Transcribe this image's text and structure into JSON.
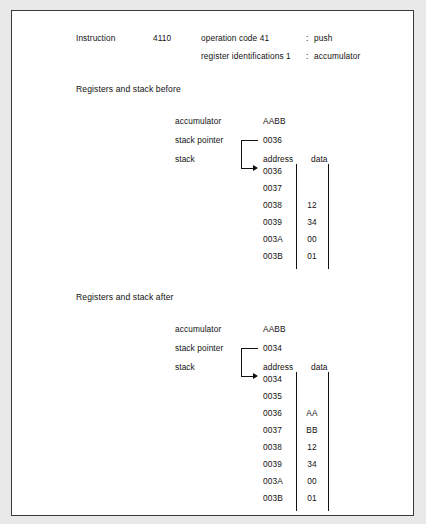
{
  "figure": {
    "instruction": {
      "label": "Instruction",
      "value": "4110",
      "fields": [
        {
          "name": "operation code 41",
          "colon": ":",
          "meaning": "push"
        },
        {
          "name": "register identifications 1",
          "colon": ":",
          "meaning": "accumulator"
        }
      ]
    },
    "sections": [
      {
        "title": "Registers and stack before",
        "registers": [
          {
            "label": "accumulator",
            "value": "AABB"
          },
          {
            "label": "stack pointer",
            "value": "0036"
          },
          {
            "label": "stack",
            "value": ""
          }
        ],
        "columns": {
          "address": "address",
          "data": "data"
        },
        "pointer_target": "0036",
        "rows": [
          {
            "address": "0036",
            "data": ""
          },
          {
            "address": "0037",
            "data": ""
          },
          {
            "address": "0038",
            "data": "12"
          },
          {
            "address": "0039",
            "data": "34"
          },
          {
            "address": "003A",
            "data": "00"
          },
          {
            "address": "003B",
            "data": "01"
          }
        ]
      },
      {
        "title": "Registers and stack after",
        "registers": [
          {
            "label": "accumulator",
            "value": "AABB"
          },
          {
            "label": "stack pointer",
            "value": "0034"
          },
          {
            "label": "stack",
            "value": ""
          }
        ],
        "columns": {
          "address": "address",
          "data": "data"
        },
        "pointer_target": "0034",
        "rows": [
          {
            "address": "0034",
            "data": ""
          },
          {
            "address": "0035",
            "data": ""
          },
          {
            "address": "0036",
            "data": "AA"
          },
          {
            "address": "0037",
            "data": "BB"
          },
          {
            "address": "0038",
            "data": "12"
          },
          {
            "address": "0039",
            "data": "34"
          },
          {
            "address": "003A",
            "data": "00"
          },
          {
            "address": "003B",
            "data": "01"
          }
        ]
      }
    ]
  }
}
